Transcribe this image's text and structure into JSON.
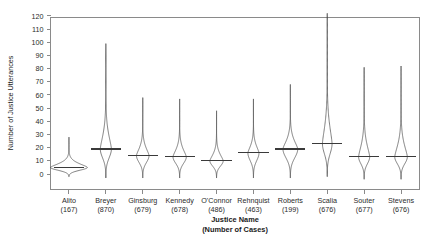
{
  "chart_data": {
    "type": "violin",
    "title": "",
    "xlabel": "Justice Name",
    "xlabel_line2": "(Number of Cases)",
    "ylabel": "Number of Justice Utterances",
    "ylim": [
      0,
      125
    ],
    "yticks": [
      0,
      10,
      20,
      30,
      40,
      50,
      60,
      70,
      80,
      90,
      100,
      110,
      120
    ],
    "grid": false,
    "legend": "none",
    "categories": [
      "Alito",
      "Breyer",
      "Ginsburg",
      "Kennedy",
      "O'Connor",
      "Rehnquist",
      "Roberts",
      "Scalia",
      "Souter",
      "Stevens"
    ],
    "case_counts": [
      167,
      870,
      679,
      678,
      486,
      463,
      199,
      676,
      677,
      676
    ],
    "tick_labels_x": [
      "Alito",
      "Breyer",
      "Ginsburg",
      "Kennedy",
      "O'Connor",
      "Rehnquist",
      "Roberts",
      "Scalia",
      "Souter",
      "Stevens"
    ],
    "tick_labels_x_line2": [
      "(167)",
      "(870)",
      "(679)",
      "(678)",
      "(486)",
      "(463)",
      "(199)",
      "(676)",
      "(677)",
      "(676)"
    ],
    "series": [
      {
        "name": "Alito",
        "cases": 167,
        "median": 5,
        "min": -2,
        "max": 28,
        "max_width": 1.0,
        "width_at_median": 1.0
      },
      {
        "name": "Breyer",
        "cases": 870,
        "median": 19,
        "min": -3,
        "max": 99,
        "max_width": 0.3,
        "width_at_median": 0.3
      },
      {
        "name": "Ginsburg",
        "cases": 679,
        "median": 14,
        "min": -3,
        "max": 58,
        "max_width": 0.34,
        "width_at_median": 0.34
      },
      {
        "name": "Kennedy",
        "cases": 678,
        "median": 13,
        "min": -3,
        "max": 57,
        "max_width": 0.36,
        "width_at_median": 0.36
      },
      {
        "name": "O'Connor",
        "cases": 486,
        "median": 10,
        "min": -3,
        "max": 48,
        "max_width": 0.36,
        "width_at_median": 0.36
      },
      {
        "name": "Rehnquist",
        "cases": 463,
        "median": 16,
        "min": -3,
        "max": 57,
        "max_width": 0.3,
        "width_at_median": 0.3
      },
      {
        "name": "Roberts",
        "cases": 199,
        "median": 19,
        "min": -3,
        "max": 68,
        "max_width": 0.4,
        "width_at_median": 0.4
      },
      {
        "name": "Scalia",
        "cases": 676,
        "median": 23,
        "min": -2,
        "max": 122,
        "max_width": 0.26,
        "width_at_median": 0.26
      },
      {
        "name": "Souter",
        "cases": 677,
        "median": 13,
        "min": -4,
        "max": 81,
        "max_width": 0.3,
        "width_at_median": 0.3
      },
      {
        "name": "Stevens",
        "cases": 676,
        "median": 13,
        "min": -4,
        "max": 82,
        "max_width": 0.34,
        "width_at_median": 0.34
      }
    ],
    "colors": {
      "axis": "#8a8a8a",
      "violin_outline": "#4a4a4a",
      "median_line": "#3a3a3a",
      "text": "#1a1a1a",
      "background": "#ffffff"
    }
  }
}
